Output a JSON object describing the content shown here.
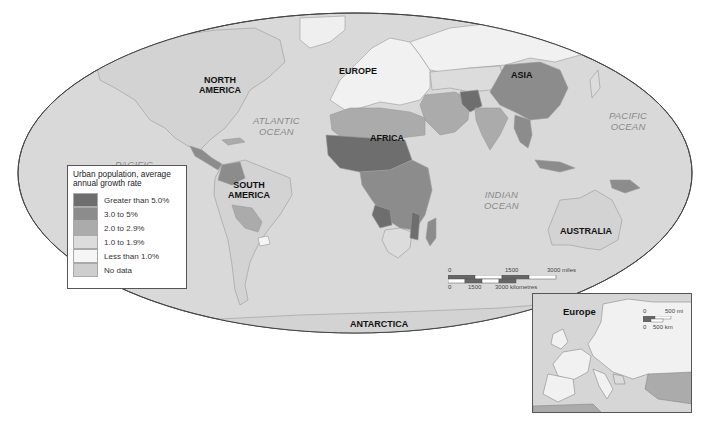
{
  "map": {
    "title": "Urban population, average annual growth rate",
    "projection": "world-ellipse",
    "background_color": "#ffffff",
    "ocean_color": "#d9d9d9",
    "continent_labels": {
      "north_america": "NORTH\nAMERICA",
      "south_america": "SOUTH\nAMERICA",
      "europe": "EUROPE",
      "africa": "AFRICA",
      "asia": "ASIA",
      "australia": "AUSTRALIA",
      "antarctica": "ANTARCTICA"
    },
    "ocean_labels": {
      "atlantic": "ATLANTIC\nOCEAN",
      "pacific_east": "PACIFIC\nOCEAN",
      "pacific_west": "PACIFIC",
      "indian": "INDIAN\nOCEAN"
    }
  },
  "legend": {
    "title": "Urban population, average annual growth rate",
    "items": [
      {
        "label": "Greater than 5.0%",
        "color": "#6e6e6e"
      },
      {
        "label": "3.0 to 5%",
        "color": "#8c8c8c"
      },
      {
        "label": "2.0 to 2.9%",
        "color": "#ababab"
      },
      {
        "label": "1.0 to 1.9%",
        "color": "#dcdcdc"
      },
      {
        "label": "Less than 1.0%",
        "color": "#f5f5f5"
      },
      {
        "label": "No data",
        "color": "#cecece"
      }
    ]
  },
  "scale_bar": {
    "miles": {
      "start": "0",
      "mid": "1500",
      "end": "3000 miles"
    },
    "km": {
      "start": "0",
      "mid": "1500",
      "end": "3000 kilometres"
    }
  },
  "inset": {
    "title": "Europe",
    "scale_bar": {
      "miles": {
        "start": "0",
        "end": "500 mi"
      },
      "km": {
        "start": "0",
        "end": "500 km"
      }
    }
  }
}
